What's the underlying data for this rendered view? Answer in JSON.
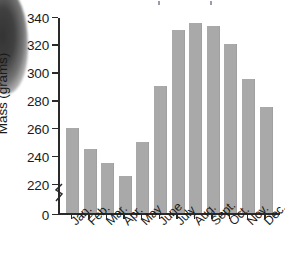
{
  "chart_data": {
    "type": "bar",
    "title": "",
    "xlabel": "",
    "ylabel": "Mass (grams)",
    "categories": [
      "Jan.",
      "Feb.",
      "Mar.",
      "Apr.",
      "May",
      "June",
      "July",
      "Aug.",
      "Sept.",
      "Oct.",
      "Nov.",
      "Dec."
    ],
    "values": [
      260,
      245,
      235,
      225,
      250,
      290,
      330,
      335,
      333,
      320,
      295,
      275
    ],
    "ylim": [
      220,
      340
    ],
    "yticks": [
      0,
      220,
      240,
      260,
      280,
      300,
      320,
      340
    ],
    "ytick_labels": [
      "0",
      "220",
      "240",
      "260",
      "280",
      "300",
      "320",
      "340"
    ],
    "axis_break": true,
    "axis_break_between": [
      0,
      220
    ],
    "grid": false,
    "legend": null,
    "bar_color": "#a9a9a9",
    "axis_color": "#2a2a2a",
    "background": "#ffffff"
  }
}
